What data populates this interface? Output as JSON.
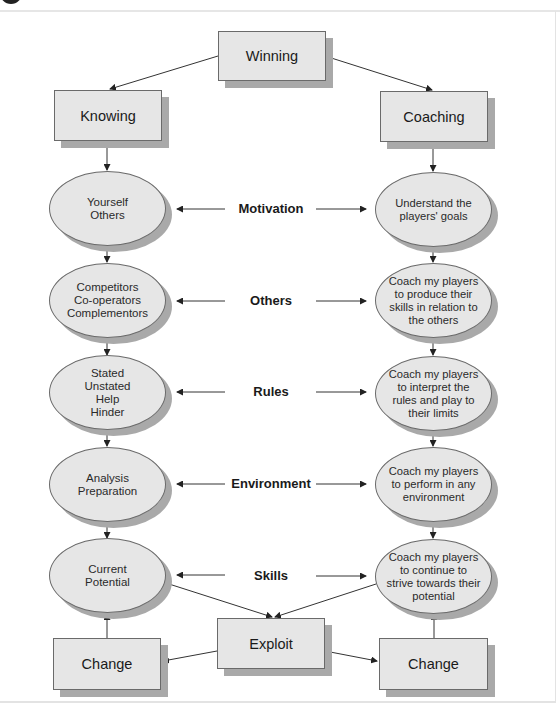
{
  "diagram": {
    "top": {
      "label": "Winning"
    },
    "columns": {
      "left": {
        "label": "Knowing"
      },
      "right": {
        "label": "Coaching"
      }
    },
    "rows": [
      {
        "label": "Motivation",
        "left": "Yourself\nOthers",
        "right": "Understand the\nplayers' goals"
      },
      {
        "label": "Others",
        "left": "Competitors\nCo-operators\nComplementors",
        "right": "Coach my players\nto produce their\nskills in relation to\nthe others"
      },
      {
        "label": "Rules",
        "left": "Stated\nUnstated\nHelp\nHinder",
        "right": "Coach my players\nto interpret the\nrules and play to\ntheir limits"
      },
      {
        "label": "Environment",
        "left": "Analysis\nPreparation",
        "right": "Coach my players\nto perform in any\nenvironment"
      },
      {
        "label": "Skills",
        "left": "Current\nPotential",
        "right": "Coach my players\nto continue to\nstrive towards their\npotential"
      }
    ],
    "bottom": {
      "center": {
        "label": "Exploit"
      },
      "left": {
        "label": "Change"
      },
      "right": {
        "label": "Change"
      }
    },
    "colors": {
      "node_fill": "#e6e6e6",
      "node_border": "#6a6a6a",
      "shadow": "#a9a9a9",
      "line": "#333333"
    }
  }
}
